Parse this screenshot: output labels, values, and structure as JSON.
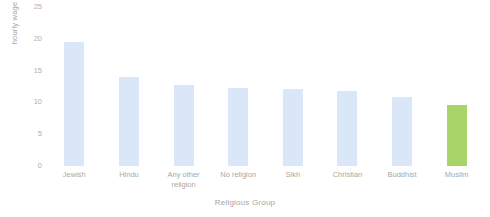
{
  "chart_data": {
    "type": "bar",
    "title": "",
    "xlabel": "Religious Group",
    "ylabel": "hourly wage (£)",
    "categories": [
      "Jewish",
      "Hindu",
      "Any other religion",
      "No religion",
      "Sikh",
      "Christian",
      "Buddhist",
      "Muslim"
    ],
    "values": [
      19.5,
      14.0,
      12.8,
      12.3,
      12.1,
      11.8,
      10.8,
      9.6
    ],
    "ylim": [
      0,
      25
    ],
    "yticks": [
      0,
      5,
      10,
      15,
      20,
      25
    ],
    "ytick_labels": [
      "0",
      "5",
      "10",
      "15",
      "20",
      "25"
    ],
    "grid": false,
    "legend": "none",
    "bar_colors": [
      "#d9e7f9",
      "#d9e7f9",
      "#d9e7f9",
      "#d9e7f9",
      "#d9e7f9",
      "#d9e7f9",
      "#d9e7f9",
      "#a9d46a"
    ],
    "highlight_color": "#a9d46a",
    "default_bar_color": "#d9e7f9",
    "background_color": "#ffffff",
    "text_color": "#a8a8a8"
  }
}
